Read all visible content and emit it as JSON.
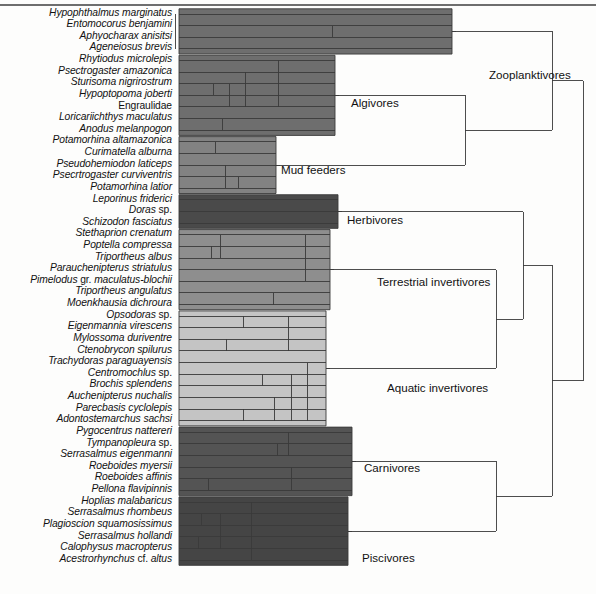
{
  "figure": {
    "type": "dendrogram",
    "orientation": "horizontal-left-to-right",
    "top_rule": true,
    "background": "#fdfdfc",
    "line_color": "#3a3a3a"
  },
  "taxa": [
    {
      "i": 0,
      "name": "Hypophthalmus marginatus",
      "group": "zooplanktivores"
    },
    {
      "i": 1,
      "name": "Entomocorus benjamini",
      "group": "zooplanktivores"
    },
    {
      "i": 2,
      "name": "Aphyocharax anisitsi",
      "group": "zooplanktivores"
    },
    {
      "i": 3,
      "name": "Ageneiosus brevis",
      "group": "zooplanktivores"
    },
    {
      "i": 4,
      "name": "Rhytiodus microlepis",
      "group": "algivores"
    },
    {
      "i": 5,
      "name": "Psectrogaster amazonica",
      "group": "algivores"
    },
    {
      "i": 6,
      "name": "Sturisoma nigrirostrum",
      "group": "algivores"
    },
    {
      "i": 7,
      "name": "Hypoptopoma joberti",
      "group": "algivores"
    },
    {
      "i": 8,
      "name": "Engraulidae",
      "group": "algivores",
      "italic": false
    },
    {
      "i": 9,
      "name": "Loricariichthys maculatus",
      "group": "algivores"
    },
    {
      "i": 10,
      "name": "Anodus melanpogon",
      "group": "algivores"
    },
    {
      "i": 11,
      "name": "Potamorhina altamazonica",
      "group": "mud-feeders"
    },
    {
      "i": 12,
      "name": "Curimatella alburna",
      "group": "mud-feeders"
    },
    {
      "i": 13,
      "name": "Pseudohemiodon laticeps",
      "group": "mud-feeders"
    },
    {
      "i": 14,
      "name": "Psecrtrogaster curviventris",
      "group": "mud-feeders"
    },
    {
      "i": 15,
      "name": "Potamorhina latior",
      "group": "mud-feeders"
    },
    {
      "i": 16,
      "name": "Leporinus friderici",
      "group": "herbivores"
    },
    {
      "i": 17,
      "name": "Doras sp.",
      "group": "herbivores",
      "suffix": " sp."
    },
    {
      "i": 18,
      "name": "Schizodon fasciatus",
      "group": "herbivores"
    },
    {
      "i": 19,
      "name": "Stethaprion crenatum",
      "group": "terrestrial-invertivores"
    },
    {
      "i": 20,
      "name": "Poptella compressa",
      "group": "terrestrial-invertivores"
    },
    {
      "i": 21,
      "name": "Triportheus albus",
      "group": "terrestrial-invertivores"
    },
    {
      "i": 22,
      "name": "Parauchenipterus striatulus",
      "group": "terrestrial-invertivores"
    },
    {
      "i": 23,
      "name": "Pimelodus gr. maculatus-blochii",
      "group": "terrestrial-invertivores"
    },
    {
      "i": 24,
      "name": "Triportheus angulatus",
      "group": "terrestrial-invertivores"
    },
    {
      "i": 25,
      "name": "Moenkhausia dichroura",
      "group": "terrestrial-invertivores"
    },
    {
      "i": 26,
      "name": "Opsodoras sp.",
      "group": "aquatic-invertivores"
    },
    {
      "i": 27,
      "name": "Eigenmannia virescens",
      "group": "aquatic-invertivores"
    },
    {
      "i": 28,
      "name": "Mylossoma duriventre",
      "group": "aquatic-invertivores"
    },
    {
      "i": 29,
      "name": "Ctenobrycon spilurus",
      "group": "aquatic-invertivores"
    },
    {
      "i": 30,
      "name": "Trachydoras paraguayensis",
      "group": "aquatic-invertivores"
    },
    {
      "i": 31,
      "name": "Centromochlus sp.",
      "group": "aquatic-invertivores"
    },
    {
      "i": 32,
      "name": "Brochis splendens",
      "group": "aquatic-invertivores"
    },
    {
      "i": 33,
      "name": "Auchenipterus nuchalis",
      "group": "aquatic-invertivores"
    },
    {
      "i": 34,
      "name": "Parecbasis cyclolepis",
      "group": "aquatic-invertivores"
    },
    {
      "i": 35,
      "name": "Adontostemarchus sachsi",
      "group": "aquatic-invertivores"
    },
    {
      "i": 36,
      "name": "Pygocentrus nattereri",
      "group": "carnivores"
    },
    {
      "i": 37,
      "name": "Tympanopleura sp.",
      "group": "carnivores"
    },
    {
      "i": 38,
      "name": "Serrasalmus eigenmanni",
      "group": "carnivores"
    },
    {
      "i": 39,
      "name": "Roeboides myersii",
      "group": "carnivores"
    },
    {
      "i": 40,
      "name": "Roeboides affinis",
      "group": "carnivores"
    },
    {
      "i": 41,
      "name": "Pellona flavipinnis",
      "group": "carnivores"
    },
    {
      "i": 42,
      "name": "Hoplias malabaricus",
      "group": "piscivores"
    },
    {
      "i": 43,
      "name": "Serrasalmus rhombeus",
      "group": "piscivores"
    },
    {
      "i": 44,
      "name": "Plagioscion squamosissimus",
      "group": "piscivores"
    },
    {
      "i": 45,
      "name": "Serrasalmus hollandi",
      "group": "piscivores"
    },
    {
      "i": 46,
      "name": "Calophysus macropterus",
      "group": "piscivores"
    },
    {
      "i": 47,
      "name": "Acestrorhynchus cf. altus",
      "group": "piscivores"
    }
  ],
  "groups": [
    {
      "id": "zooplanktivores",
      "label": "Zooplanktivores",
      "color": "#6e6e6e",
      "x": 489,
      "y": 68
    },
    {
      "id": "algivores",
      "label": "Algivores",
      "color": "#6e6e6e",
      "x": 351,
      "y": 96
    },
    {
      "id": "mud-feeders",
      "label": "Mud feeders",
      "color": "#828282",
      "x": 281,
      "y": 163
    },
    {
      "id": "herbivores",
      "label": "Herbivores",
      "color": "#4a4a4a",
      "x": 347,
      "y": 213
    },
    {
      "id": "terrestrial-invertivores",
      "label": "Terrestrial invertivores",
      "color": "#8e8e8e",
      "x": 377,
      "y": 275
    },
    {
      "id": "aquatic-invertivores",
      "label": "Aquatic invertivores",
      "color": "#c4c4c4",
      "x": 387,
      "y": 381
    },
    {
      "id": "carnivores",
      "label": "Carnivores",
      "color": "#545454",
      "x": 364,
      "y": 461
    },
    {
      "id": "piscivores",
      "label": "Piscivores",
      "color": "#454545",
      "x": 362,
      "y": 551
    }
  ],
  "chart_data": {
    "type": "dendrogram",
    "n_leaves": 48,
    "leaf_rows": {
      "first_y": 14,
      "spacing": 11.62
    },
    "clusters": [
      {
        "group": "zooplanktivores",
        "leaves": [
          0,
          1,
          2,
          3
        ],
        "merges": [
          {
            "members": [
              1,
              2
            ],
            "x": 332
          },
          {
            "members": [
              0,
              1,
              2,
              3
            ],
            "x": 175
          },
          {
            "root_x": 452
          }
        ]
      },
      {
        "group": "algivores",
        "leaves": [
          4,
          5,
          6,
          7,
          8,
          9,
          10
        ],
        "merges": [
          {
            "members": [
              6,
              7
            ],
            "x": 213
          },
          {
            "members": [
              6,
              7,
              8
            ],
            "x": 229
          },
          {
            "members": [
              5,
              6,
              7,
              8
            ],
            "x": 245
          },
          {
            "members": [
              4,
              5,
              6,
              7,
              8
            ],
            "x": 278
          },
          {
            "members": [
              9,
              10
            ],
            "x": 222
          },
          {
            "root_x": 335
          }
        ]
      },
      {
        "group": "mud-feeders",
        "leaves": [
          11,
          12,
          13,
          14,
          15
        ],
        "merges": [
          {
            "members": [
              11,
              12
            ],
            "x": 215
          },
          {
            "members": [
              14,
              15
            ],
            "x": 238
          },
          {
            "members": [
              13,
              14,
              15
            ],
            "x": 225
          },
          {
            "root_x": 276
          }
        ]
      },
      {
        "group": "herbivores",
        "leaves": [
          16,
          17,
          18
        ],
        "merges": [
          {
            "root_x": 338
          }
        ]
      },
      {
        "group": "terrestrial-invertivores",
        "leaves": [
          19,
          20,
          21,
          22,
          23,
          24,
          25
        ],
        "merges": [
          {
            "members": [
              20,
              21
            ],
            "x": 211
          },
          {
            "members": [
              19,
              20,
              21
            ],
            "x": 220
          },
          {
            "members": [
              19,
              20,
              21,
              22,
              23
            ],
            "x": 305
          },
          {
            "members": [
              24,
              25
            ],
            "x": 273
          },
          {
            "root_x": 330
          }
        ]
      },
      {
        "group": "aquatic-invertivores",
        "leaves": [
          26,
          27,
          28,
          29,
          30,
          31,
          32,
          33,
          34,
          35
        ],
        "merges": [
          {
            "members": [
              26,
              27
            ],
            "x": 243
          },
          {
            "members": [
              28,
              29
            ],
            "x": 226
          },
          {
            "members": [
              26,
              27,
              28,
              29
            ],
            "x": 288
          },
          {
            "members": [
              31,
              32
            ],
            "x": 262
          },
          {
            "members": [
              34,
              35
            ],
            "x": 243
          },
          {
            "members": [
              33,
              34,
              35
            ],
            "x": 274
          },
          {
            "members": [
              31,
              32,
              33,
              34,
              35
            ],
            "x": 291
          },
          {
            "members": [
              30,
              31,
              32,
              33,
              34,
              35
            ],
            "x": 307
          },
          {
            "root_x": 326
          }
        ]
      },
      {
        "group": "carnivores",
        "leaves": [
          36,
          37,
          38,
          39,
          40,
          41
        ],
        "merges": [
          {
            "members": [
              37,
              38
            ],
            "x": 277
          },
          {
            "members": [
              36,
              37,
              38
            ],
            "x": 288
          },
          {
            "members": [
              40,
              41
            ],
            "x": 208
          },
          {
            "members": [
              39,
              40,
              41
            ],
            "x": 291
          },
          {
            "root_x": 352
          }
        ]
      },
      {
        "group": "piscivores",
        "leaves": [
          42,
          43,
          44,
          45,
          46,
          47
        ],
        "merges": [
          {
            "members": [
              43,
              44
            ],
            "x": 201
          },
          {
            "members": [
              45,
              46
            ],
            "x": 198
          },
          {
            "members": [
              43,
              44,
              45,
              46
            ],
            "x": 220
          },
          {
            "members": [
              42,
              43,
              44,
              45,
              46,
              47
            ],
            "x": 251
          },
          {
            "root_x": 348
          }
        ]
      }
    ],
    "backbone": [
      {
        "name": "algivores+mud-feeders",
        "x": 465,
        "children": [
          "algivores",
          "mud-feeders"
        ]
      },
      {
        "name": "terrestrial+aquatic",
        "x": 496,
        "children": [
          "terrestrial-invertivores",
          "aquatic-invertivores"
        ]
      },
      {
        "name": "herbivores+inverts",
        "x": 523,
        "children": [
          "herbivores",
          "terrestrial+aquatic"
        ]
      },
      {
        "name": "carnivores+piscivores",
        "x": 496,
        "children": [
          "carnivores",
          "piscivores"
        ]
      },
      {
        "name": "upper-clade",
        "x": 552,
        "children": [
          "zooplanktivores",
          "algivores+mud-feeders"
        ]
      },
      {
        "name": "lower-clade",
        "x": 552,
        "children": [
          "herbivores+inverts",
          "carnivores+piscivores"
        ]
      },
      {
        "name": "root",
        "x": 583,
        "children": [
          "upper-clade",
          "lower-clade"
        ]
      }
    ]
  }
}
